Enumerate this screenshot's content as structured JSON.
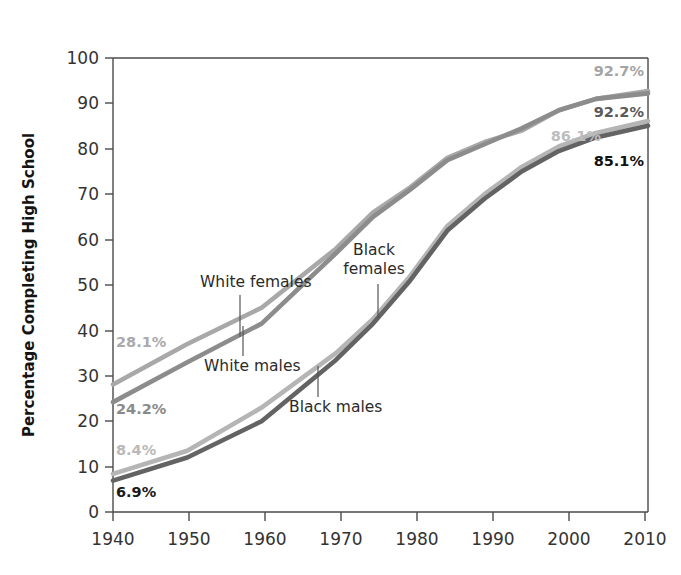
{
  "chart_data": {
    "type": "line",
    "title": "",
    "xlabel": "",
    "ylabel": "Percentage Completing High School",
    "xlim": [
      1940,
      2012
    ],
    "ylim": [
      0,
      100
    ],
    "grid": false,
    "legend_position": "inline-annotations",
    "x_ticks": [
      "1940",
      "1950",
      "1960",
      "1970",
      "1980",
      "1990",
      "2000",
      "2010"
    ],
    "x_tick_values": [
      1940,
      1950,
      1960,
      1970,
      1980,
      1990,
      2000,
      2010
    ],
    "y_ticks": [
      "0",
      "10",
      "20",
      "30",
      "40",
      "50",
      "60",
      "70",
      "80",
      "90",
      "100"
    ],
    "y_tick_values": [
      0,
      10,
      20,
      30,
      40,
      50,
      60,
      70,
      80,
      90,
      100
    ],
    "x": [
      1940,
      1950,
      1960,
      1970,
      1975,
      1980,
      1985,
      1990,
      1995,
      2000,
      2005,
      2012
    ],
    "series": [
      {
        "name": "White females",
        "color": "#a8a8a8",
        "values": [
          28.1,
          37.0,
          45.0,
          58.0,
          66.0,
          71.5,
          78.0,
          81.5,
          84.0,
          88.5,
          91.0,
          92.7
        ],
        "start_label": "28.1%",
        "end_label": "92.7%"
      },
      {
        "name": "White males",
        "color": "#8c8c8c",
        "values": [
          24.2,
          33.0,
          41.5,
          57.0,
          65.0,
          71.0,
          77.5,
          81.0,
          84.5,
          88.5,
          91.0,
          92.2
        ],
        "start_label": "24.2%",
        "end_label": "92.2%"
      },
      {
        "name": "Black females",
        "color": "#b5b5b5",
        "values": [
          8.4,
          13.5,
          23.0,
          35.0,
          42.5,
          52.0,
          63.0,
          70.0,
          76.0,
          80.5,
          83.5,
          86.1
        ],
        "start_label": "8.4%",
        "end_label": "86.1%"
      },
      {
        "name": "Black males",
        "color": "#636363",
        "values": [
          6.9,
          12.0,
          20.0,
          33.5,
          41.5,
          51.0,
          62.0,
          69.0,
          75.0,
          79.5,
          82.5,
          85.1
        ],
        "start_label": "6.9%",
        "end_label": "85.1%"
      }
    ],
    "annotations": [
      {
        "text": "White females",
        "color": "#2b2b2b"
      },
      {
        "text": "White males",
        "color": "#2b2b2b"
      },
      {
        "text": "Black females",
        "color": "#2b2b2b"
      },
      {
        "text": "Black males",
        "color": "#2b2b2b"
      }
    ],
    "value_labels": {
      "white_females_start": "28.1%",
      "white_males_start": "24.2%",
      "black_females_start": "8.4%",
      "black_males_start": "6.9%",
      "white_females_end": "92.7%",
      "white_males_end": "92.2%",
      "black_females_end": "86.1%",
      "black_males_end": "85.1%"
    },
    "label_colors": {
      "white_females": "#aaaaaa",
      "white_males": "#8a8a8a",
      "black_females": "#b9b9b9",
      "black_males": "#1a1a1a"
    }
  }
}
